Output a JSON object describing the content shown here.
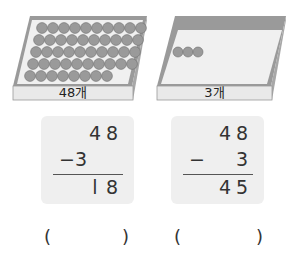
{
  "boxes": [
    {
      "label": "48개",
      "coin_count": 48,
      "rows": [
        10,
        10,
        10,
        10,
        8
      ]
    },
    {
      "label": "3개",
      "coin_count": 3,
      "rows": [
        3
      ]
    }
  ],
  "problems": [
    {
      "minuend": [
        "4",
        "8"
      ],
      "operator": "−",
      "subtrahend": "3",
      "result": [
        "l",
        "8"
      ],
      "answer_blank": {
        "open": "(",
        "close": ")"
      }
    },
    {
      "minuend": [
        "4",
        "8"
      ],
      "operator": "−",
      "subtrahend": "3",
      "result": [
        "4",
        "5"
      ],
      "answer_blank": {
        "open": "(",
        "close": ")"
      }
    }
  ],
  "colors": {
    "coin": "#9a9a9a",
    "coin_edge": "#6e6e6e",
    "box_rim": "#8c8c8c",
    "box_floor": "#f2f2f2",
    "card_bg": "#efefef"
  }
}
